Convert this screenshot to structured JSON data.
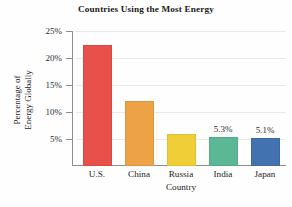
{
  "chart_data": {
    "type": "bar",
    "title": "Countries Using the Most Energy",
    "xlabel": "Country",
    "ylabel_lines": [
      "Percentage of",
      "Energy Globally"
    ],
    "ylabel": "Percentage of Energy Globally",
    "categories": [
      "U.S.",
      "China",
      "Russia",
      "India",
      "Japan"
    ],
    "values": [
      22.5,
      12.0,
      6.0,
      5.3,
      5.1
    ],
    "value_labels": [
      "",
      "",
      "",
      "5.3%",
      "5.1%"
    ],
    "colors": [
      "#e8504a",
      "#eda245",
      "#f0ce37",
      "#5cb795",
      "#4272b0"
    ],
    "ylim": [
      0,
      25
    ],
    "yticks": [
      5,
      10,
      15,
      20,
      25
    ],
    "ytick_labels": [
      "5%",
      "10%",
      "15%",
      "20%",
      "25%"
    ],
    "grid": true,
    "legend": "none"
  }
}
